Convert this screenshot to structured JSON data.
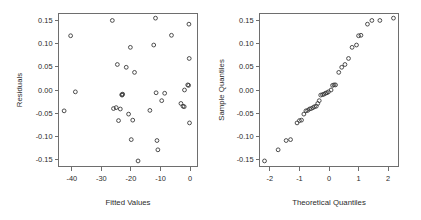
{
  "figure": {
    "background": "#ffffff",
    "point_color": "#3a3a3a",
    "axis_color": "#6e6e6e",
    "text_color": "#2b2b2b",
    "panel_count": 2
  },
  "chart_data": [
    {
      "type": "scatter",
      "title": "",
      "xlabel": "Fitted Values",
      "ylabel": "Residuals",
      "xlim": [
        -44.5,
        2.5
      ],
      "ylim": [
        -0.165,
        0.165
      ],
      "xticks": [
        -40,
        -30,
        -20,
        -10,
        0
      ],
      "xtick_labels": [
        "-40",
        "-30",
        "-20",
        "-10",
        "0"
      ],
      "yticks": [
        0.15,
        0.1,
        0.05,
        0.0,
        -0.05,
        -0.1,
        -0.15
      ],
      "ytick_labels": [
        "0.15",
        "0.10",
        "0.05",
        "0.00",
        "-0.05",
        "-0.10",
        "-0.15"
      ],
      "grid": false,
      "legend": false,
      "marker": "open-circle",
      "points": [
        [
          -42.6,
          -0.045
        ],
        [
          -40.4,
          0.117
        ],
        [
          -38.8,
          -0.004
        ],
        [
          -26.3,
          0.15
        ],
        [
          -25.9,
          -0.04
        ],
        [
          -25.0,
          -0.038
        ],
        [
          -24.6,
          0.055
        ],
        [
          -24.2,
          -0.066
        ],
        [
          -23.6,
          -0.041
        ],
        [
          -23.1,
          -0.01
        ],
        [
          -23.0,
          -0.011
        ],
        [
          -22.8,
          -0.009
        ],
        [
          -21.6,
          0.049
        ],
        [
          -20.8,
          -0.052
        ],
        [
          -20.2,
          0.092
        ],
        [
          -19.9,
          -0.107
        ],
        [
          -19.4,
          -0.065
        ],
        [
          -18.8,
          0.038
        ],
        [
          -17.6,
          -0.153
        ],
        [
          -13.6,
          -0.044
        ],
        [
          -12.3,
          0.097
        ],
        [
          -11.7,
          0.155
        ],
        [
          -11.5,
          -0.006
        ],
        [
          -11.2,
          -0.109
        ],
        [
          -10.9,
          -0.129
        ],
        [
          -9.6,
          -0.023
        ],
        [
          -8.6,
          -0.007
        ],
        [
          -6.3,
          0.118
        ],
        [
          -3.1,
          -0.029
        ],
        [
          -2.4,
          -0.035
        ],
        [
          -2.0,
          -0.036
        ],
        [
          -1.9,
          0.0
        ],
        [
          -0.8,
          0.011
        ],
        [
          -0.5,
          0.01
        ],
        [
          -0.4,
          0.142
        ],
        [
          -0.3,
          0.068
        ],
        [
          -0.2,
          -0.071
        ]
      ]
    },
    {
      "type": "scatter",
      "title": "",
      "xlabel": "Theoretical Quantiles",
      "ylabel": "Sample Quantiles",
      "xlim": [
        -2.35,
        2.35
      ],
      "ylim": [
        -0.165,
        0.165
      ],
      "xticks": [
        -2,
        -1,
        0,
        1,
        2
      ],
      "xtick_labels": [
        "-2",
        "-1",
        "0",
        "1",
        "2"
      ],
      "yticks": [
        0.15,
        0.1,
        0.05,
        0.0,
        -0.05,
        -0.1,
        -0.15
      ],
      "ytick_labels": [
        "0.15",
        "0.10",
        "0.05",
        "0.00",
        "-0.05",
        "-0.10",
        "-0.15"
      ],
      "grid": false,
      "legend": false,
      "marker": "open-circle",
      "points": [
        [
          -2.18,
          -0.153
        ],
        [
          -1.72,
          -0.129
        ],
        [
          -1.45,
          -0.109
        ],
        [
          -1.3,
          -0.107
        ],
        [
          -1.08,
          -0.071
        ],
        [
          -1.0,
          -0.066
        ],
        [
          -0.93,
          -0.065
        ],
        [
          -0.85,
          -0.052
        ],
        [
          -0.78,
          -0.045
        ],
        [
          -0.72,
          -0.044
        ],
        [
          -0.66,
          -0.041
        ],
        [
          -0.6,
          -0.04
        ],
        [
          -0.54,
          -0.038
        ],
        [
          -0.49,
          -0.036
        ],
        [
          -0.43,
          -0.035
        ],
        [
          -0.38,
          -0.029
        ],
        [
          -0.33,
          -0.023
        ],
        [
          -0.28,
          -0.011
        ],
        [
          -0.22,
          -0.01
        ],
        [
          -0.17,
          -0.009
        ],
        [
          -0.12,
          -0.007
        ],
        [
          -0.07,
          -0.006
        ],
        [
          -0.02,
          -0.004
        ],
        [
          0.07,
          0.0
        ],
        [
          0.12,
          0.01
        ],
        [
          0.17,
          0.011
        ],
        [
          0.22,
          0.011
        ],
        [
          0.33,
          0.038
        ],
        [
          0.43,
          0.049
        ],
        [
          0.54,
          0.055
        ],
        [
          0.66,
          0.068
        ],
        [
          0.78,
          0.092
        ],
        [
          0.93,
          0.097
        ],
        [
          1.0,
          0.117
        ],
        [
          1.08,
          0.118
        ],
        [
          1.3,
          0.142
        ],
        [
          1.45,
          0.15
        ],
        [
          1.72,
          0.15
        ],
        [
          2.18,
          0.155
        ]
      ]
    }
  ],
  "panels": [
    {
      "name": "residuals-vs-fitted",
      "xlabel": "Fitted Values",
      "ylabel": "Residuals"
    },
    {
      "name": "normal-qq",
      "xlabel": "Theoretical Quantiles",
      "ylabel": "Sample Quantiles"
    }
  ]
}
